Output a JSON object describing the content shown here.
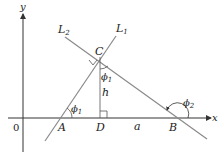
{
  "diagram": {
    "axes": {
      "x_label": "x",
      "y_label": "y",
      "origin_label": "0"
    },
    "lines": {
      "L1": {
        "label": "L",
        "subscript": "1"
      },
      "L2": {
        "label": "L",
        "subscript": "2"
      }
    },
    "points": {
      "A": "A",
      "B": "B",
      "C": "C",
      "D": "D"
    },
    "segments": {
      "height": "h",
      "base": "a"
    },
    "angles": {
      "phi1_at_A": {
        "symbol": "ϕ",
        "subscript": "1"
      },
      "phi1_at_C": {
        "symbol": "ϕ",
        "subscript": "1"
      },
      "phi2_at_B": {
        "symbol": "ϕ",
        "subscript": "2"
      }
    },
    "colors": {
      "axis": "#333333",
      "line": "#8a8a8a",
      "text": "#222222"
    }
  }
}
